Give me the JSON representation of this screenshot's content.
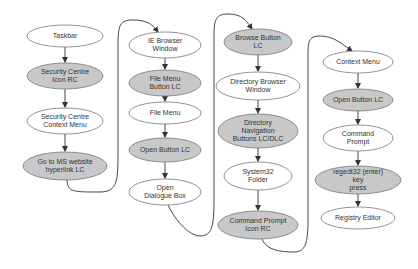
{
  "diagram": {
    "type": "flowchart",
    "colors": {
      "shaded_fill": "#c8c8c8",
      "plain_fill": "#ffffff",
      "stroke": "#777777",
      "connector": "#333333"
    },
    "columns": [
      {
        "id": "col1",
        "nodes": [
          {
            "id": "n1",
            "label": "Taskbar",
            "shaded": false,
            "cx": 65,
            "cy": 36,
            "rx": 38,
            "ry": 11
          },
          {
            "id": "n2",
            "label": "Security Centre\nIcon RC",
            "shaded": true,
            "cx": 65,
            "cy": 76,
            "rx": 38,
            "ry": 13
          },
          {
            "id": "n3",
            "label": "Security Centre\nContext Menu",
            "shaded": false,
            "cx": 65,
            "cy": 121,
            "rx": 38,
            "ry": 13
          },
          {
            "id": "n4",
            "label": "Go to MS website\nhyperlink LC",
            "shaded": true,
            "cx": 65,
            "cy": 166,
            "rx": 42,
            "ry": 14
          }
        ]
      },
      {
        "id": "col2",
        "nodes": [
          {
            "id": "n5",
            "label": "IE Browser\nWindow",
            "shaded": false,
            "cx": 165,
            "cy": 45,
            "rx": 36,
            "ry": 13
          },
          {
            "id": "n6",
            "label": "File Menu\nButton LC",
            "shaded": true,
            "cx": 165,
            "cy": 83,
            "rx": 36,
            "ry": 13
          },
          {
            "id": "n7",
            "label": "File Menu",
            "shaded": false,
            "cx": 165,
            "cy": 113,
            "rx": 36,
            "ry": 11
          },
          {
            "id": "n8",
            "label": "Open Button LC",
            "shaded": true,
            "cx": 165,
            "cy": 150,
            "rx": 36,
            "ry": 12
          },
          {
            "id": "n9",
            "label": "Open\nDialogue Box",
            "shaded": false,
            "cx": 165,
            "cy": 192,
            "rx": 36,
            "ry": 13
          }
        ]
      },
      {
        "id": "col3",
        "nodes": [
          {
            "id": "n10",
            "label": "Browse Button\nLC",
            "shaded": true,
            "cx": 258,
            "cy": 42,
            "rx": 34,
            "ry": 13
          },
          {
            "id": "n11",
            "label": "Directory Browser\nWindow",
            "shaded": false,
            "cx": 258,
            "cy": 86,
            "rx": 42,
            "ry": 14
          },
          {
            "id": "n12",
            "label": "Directory\nNavigation\nButtons LC/DLC",
            "shaded": true,
            "cx": 258,
            "cy": 131,
            "rx": 40,
            "ry": 17
          },
          {
            "id": "n13",
            "label": "System32\nFolder",
            "shaded": false,
            "cx": 258,
            "cy": 176,
            "rx": 34,
            "ry": 14
          },
          {
            "id": "n14",
            "label": "Command Prompt\nIcon RC",
            "shaded": true,
            "cx": 258,
            "cy": 225,
            "rx": 40,
            "ry": 14
          }
        ]
      },
      {
        "id": "col4",
        "nodes": [
          {
            "id": "n15",
            "label": "Context Menu",
            "shaded": false,
            "cx": 358,
            "cy": 62,
            "rx": 35,
            "ry": 11
          },
          {
            "id": "n16",
            "label": "Open Button LC",
            "shaded": true,
            "cx": 358,
            "cy": 100,
            "rx": 35,
            "ry": 11
          },
          {
            "id": "n17",
            "label": "Command\nPrompt",
            "shaded": false,
            "cx": 358,
            "cy": 138,
            "rx": 35,
            "ry": 13
          },
          {
            "id": "n18",
            "label": "regedt32 (enter) key\npress",
            "shaded": true,
            "cx": 358,
            "cy": 180,
            "rx": 43,
            "ry": 14
          },
          {
            "id": "n19",
            "label": "Registry Editor",
            "shaded": false,
            "cx": 358,
            "cy": 218,
            "rx": 37,
            "ry": 11
          }
        ]
      }
    ],
    "edges": [
      [
        "n1",
        "n2"
      ],
      [
        "n2",
        "n3"
      ],
      [
        "n3",
        "n4"
      ],
      [
        "n4",
        "n5"
      ],
      [
        "n5",
        "n6"
      ],
      [
        "n6",
        "n7"
      ],
      [
        "n7",
        "n8"
      ],
      [
        "n8",
        "n9"
      ],
      [
        "n9",
        "n10"
      ],
      [
        "n10",
        "n11"
      ],
      [
        "n11",
        "n12"
      ],
      [
        "n12",
        "n13"
      ],
      [
        "n13",
        "n14"
      ],
      [
        "n14",
        "n15"
      ],
      [
        "n15",
        "n16"
      ],
      [
        "n16",
        "n17"
      ],
      [
        "n17",
        "n18"
      ],
      [
        "n18",
        "n19"
      ]
    ]
  }
}
